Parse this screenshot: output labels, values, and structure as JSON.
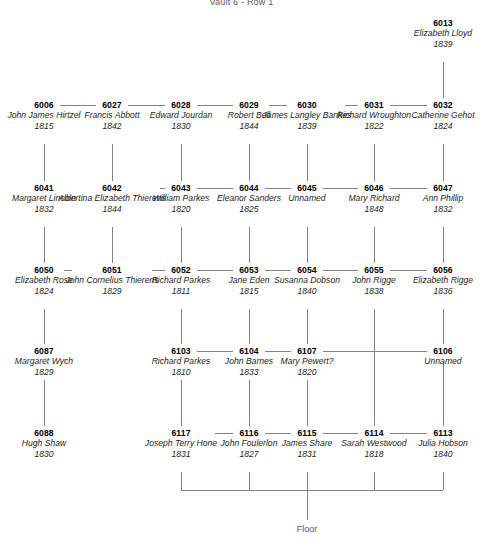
{
  "page": {
    "title": "Vault 6 - Row 1",
    "floor_label": "Floor",
    "line_color": "#808285",
    "id_color": "#000000",
    "text_color": "#231f20"
  },
  "nodes": [
    {
      "id": "6013",
      "name": "Elizabeth Lloyd",
      "year": "1839",
      "col": 7,
      "row": 0
    },
    {
      "id": "6006",
      "name": "John James Hirtzel",
      "year": "1815",
      "col": 1,
      "row": 1
    },
    {
      "id": "6027",
      "name": "Francis Abbott",
      "year": "1842",
      "col": 2,
      "row": 1
    },
    {
      "id": "6028",
      "name": "Edward Jourdan",
      "year": "1830",
      "col": 3,
      "row": 1
    },
    {
      "id": "6029",
      "name": "Robert Bell",
      "year": "1844",
      "col": 4,
      "row": 1
    },
    {
      "id": "6030",
      "name": "James Langley Bankes",
      "year": "1839",
      "col": 5,
      "row": 1
    },
    {
      "id": "6031",
      "name": "Richard Wroughton",
      "year": "1822",
      "col": 6,
      "row": 1
    },
    {
      "id": "6032",
      "name": "Catherine Gehot",
      "year": "1824",
      "col": 7,
      "row": 1
    },
    {
      "id": "6041",
      "name": "Margaret Lincoln",
      "year": "1832",
      "col": 1,
      "row": 2
    },
    {
      "id": "6042",
      "name": "Albertina Elizabeth Thierens",
      "year": "1844",
      "col": 2,
      "row": 2
    },
    {
      "id": "6043",
      "name": "William Parkes",
      "year": "1820",
      "col": 3,
      "row": 2
    },
    {
      "id": "6044",
      "name": "Eleanor Sanders",
      "year": "1825",
      "col": 4,
      "row": 2
    },
    {
      "id": "6045",
      "name": "Unnamed",
      "year": "",
      "col": 5,
      "row": 2
    },
    {
      "id": "6046",
      "name": "Mary Richard",
      "year": "1848",
      "col": 6,
      "row": 2
    },
    {
      "id": "6047",
      "name": "Ann Phillip",
      "year": "1832",
      "col": 7,
      "row": 2
    },
    {
      "id": "6050",
      "name": "Elizabeth Rose",
      "year": "1824",
      "col": 1,
      "row": 3
    },
    {
      "id": "6051",
      "name": "John Cornelius Thierens",
      "year": "1829",
      "col": 2,
      "row": 3
    },
    {
      "id": "6052",
      "name": "Richard Parkes",
      "year": "1811",
      "col": 3,
      "row": 3
    },
    {
      "id": "6053",
      "name": "Jane Eden",
      "year": "1815",
      "col": 4,
      "row": 3
    },
    {
      "id": "6054",
      "name": "Susanna Dobson",
      "year": "1840",
      "col": 5,
      "row": 3
    },
    {
      "id": "6055",
      "name": "John Rigge",
      "year": "1838",
      "col": 6,
      "row": 3
    },
    {
      "id": "6056",
      "name": "Elizabeth Rigge",
      "year": "1836",
      "col": 7,
      "row": 3
    },
    {
      "id": "6087",
      "name": "Margaret Wych",
      "year": "1829",
      "col": 1,
      "row": 4
    },
    {
      "id": "6103",
      "name": "Richard Parkes",
      "year": "1810",
      "col": 3,
      "row": 4
    },
    {
      "id": "6104",
      "name": "John Barnes",
      "year": "1833",
      "col": 4,
      "row": 4
    },
    {
      "id": "6107",
      "name": "Mary Pewert?",
      "year": "1820",
      "col": 5,
      "row": 4
    },
    {
      "id": "6106",
      "name": "Unnamed",
      "year": "",
      "col": 7,
      "row": 4
    },
    {
      "id": "6088",
      "name": "Hugh Shaw",
      "year": "1830",
      "col": 1,
      "row": 5
    },
    {
      "id": "6117",
      "name": "Joseph Terry Hone",
      "year": "1831",
      "col": 3,
      "row": 5
    },
    {
      "id": "6116",
      "name": "John Foulerlon",
      "year": "1827",
      "col": 4,
      "row": 5
    },
    {
      "id": "6115",
      "name": "James Share",
      "year": "1831",
      "col": 5,
      "row": 5
    },
    {
      "id": "6114",
      "name": "Sarah Westwood",
      "year": "1818",
      "col": 6,
      "row": 5
    },
    {
      "id": "6113",
      "name": "Julia Hobson",
      "year": "1840",
      "col": 7,
      "row": 5
    }
  ]
}
